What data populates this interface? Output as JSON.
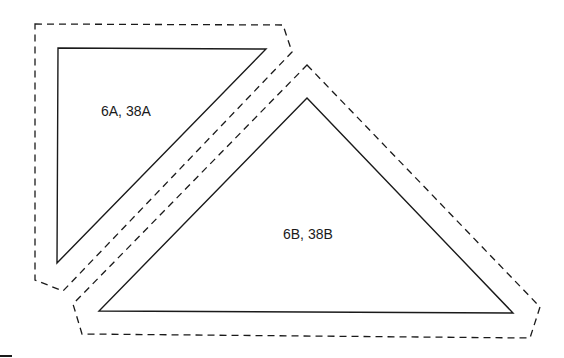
{
  "diagram": {
    "width": 564,
    "height": 358,
    "stroke_color": "#1a1a1a",
    "background": "#ffffff",
    "regions": [
      {
        "id": "region-a",
        "label": "6A, 38A",
        "shape": "right-triangle",
        "triangle_points": "58,48 266,49 57,263",
        "outline_points": "35,24 283,25 292,52 63,291 35,280",
        "label_pos": [
          101,
          116
        ]
      },
      {
        "id": "region-b",
        "label": "6B, 38B",
        "shape": "triangle",
        "triangle_points": "307,98 513,313 99,311",
        "outline_points": "307,65 540,307 530,338 82,334 73,304",
        "label_pos": [
          283,
          239
        ]
      }
    ]
  }
}
